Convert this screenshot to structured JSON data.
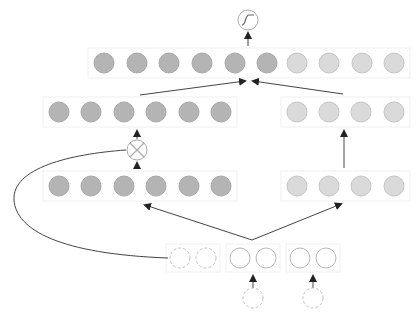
{
  "diagram": {
    "colors": {
      "dark_node_fill": "#b4b4b4",
      "dark_node_stroke": "#a8a8a8",
      "light_node_fill": "#dadada",
      "light_node_stroke": "#c4c4c4",
      "outline_node_stroke": "#b8b8b8",
      "dashed_node_stroke": "#c0c0c0",
      "edge": "#444444",
      "box_border": "#f0f0f0"
    },
    "output_op": {
      "symbol": "sigmoid",
      "x": 243,
      "y": 20
    },
    "gate_op": {
      "symbol": "multiply",
      "x": 137,
      "y": 150
    },
    "layers": {
      "top_concat": {
        "y": 63,
        "dark_x": [
          104,
          137,
          169,
          202,
          235,
          267
        ],
        "light_x": [
          297,
          329,
          362,
          394
        ]
      },
      "left_hidden_upper": {
        "y": 112,
        "dark_x": [
          59,
          91,
          124,
          156,
          189,
          221
        ]
      },
      "right_hidden_upper": {
        "y": 112,
        "light_x": [
          297,
          329,
          361,
          394
        ]
      },
      "left_hidden_lower": {
        "y": 186,
        "dark_x": [
          59,
          91,
          124,
          156,
          189,
          221
        ]
      },
      "right_hidden_lower": {
        "y": 186,
        "light_x": [
          297,
          329,
          361,
          394
        ]
      },
      "input_row": {
        "y": 258,
        "dashed_x": [
          180,
          206
        ],
        "solid_group_a_x": [
          240,
          266
        ],
        "solid_group_b_x": [
          300,
          326
        ]
      },
      "bottom_inputs": {
        "y": 298,
        "dashed_x": [
          253,
          313
        ]
      }
    }
  }
}
